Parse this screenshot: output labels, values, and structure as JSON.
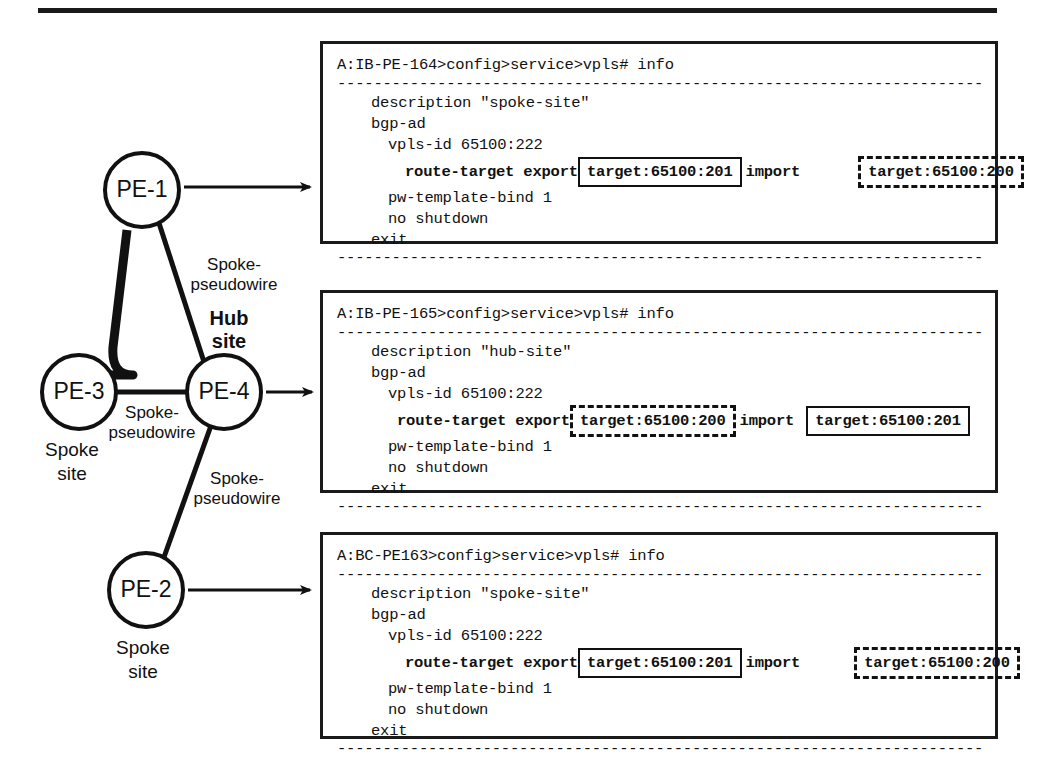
{
  "figure": {
    "title_rule": true
  },
  "topology": {
    "nodes": [
      {
        "id": "pe1",
        "label": "PE-1",
        "site": ""
      },
      {
        "id": "pe3",
        "label": "PE-3",
        "site": "Spoke site"
      },
      {
        "id": "pe4",
        "label": "PE-4",
        "site": ""
      },
      {
        "id": "pe2",
        "label": "PE-2",
        "site": "Spoke site"
      }
    ],
    "hub_label_line1": "Hub",
    "hub_label_line2": "site",
    "spoke_site_line1": "Spoke",
    "spoke_site_line2": "site",
    "edges": [
      {
        "from": "pe1",
        "to": "pe4",
        "label_line1": "Spoke-",
        "label_line2": "pseudowire"
      },
      {
        "from": "pe4",
        "to": "pe3",
        "label_line1": "Spoke-",
        "label_line2": "pseudowire"
      },
      {
        "from": "pe4",
        "to": "pe2",
        "label_line1": "Spoke-",
        "label_line2": "pseudowire"
      }
    ]
  },
  "config_boxes": [
    {
      "header": "A:IB-PE-164>config>service>vpls# info",
      "separator": "-------------------------------------------------------------------------------",
      "lines": [
        {
          "indent": 1,
          "text": "description \"spoke-site\""
        },
        {
          "indent": 1,
          "text": "bgp-ad"
        },
        {
          "indent": 2,
          "text": "vpls-id 65100:222"
        }
      ],
      "route_target": {
        "keyword": "route-target export",
        "export_value": "target:65100:201",
        "export_style": "solid",
        "import_keyword": "import",
        "import_value": "target:65100:200",
        "import_style": "dashed",
        "gap_before_import_box": 56,
        "gap_after_export_kw": 0
      },
      "lines_after": [
        {
          "indent": 2,
          "text": "pw-template-bind 1"
        },
        {
          "indent": 2,
          "text": "no shutdown"
        },
        {
          "indent": 1,
          "text": "exit"
        }
      ],
      "footer": "-------------------------------------------------------------------------------"
    },
    {
      "header": "A:IB-PE-165>config>service>vpls# info",
      "separator": "-------------------------------------------------------------------------------",
      "lines": [
        {
          "indent": 1,
          "text": "description \"hub-site\""
        },
        {
          "indent": 1,
          "text": "bgp-ad"
        },
        {
          "indent": 2,
          "text": "vpls-id 65100:222"
        }
      ],
      "route_target": {
        "keyword": "route-target export",
        "export_value": "target:65100:200",
        "export_style": "dashed",
        "import_keyword": "import",
        "import_value": "target:65100:201",
        "import_style": "solid",
        "gap_before_import_box": 10,
        "gap_after_export_kw": 0
      },
      "lines_after": [
        {
          "indent": 2,
          "text": "pw-template-bind 1"
        },
        {
          "indent": 2,
          "text": "no shutdown"
        },
        {
          "indent": 1,
          "text": "exit"
        }
      ],
      "footer": "-------------------------------------------------------------------------------"
    },
    {
      "header": "A:BC-PE163>config>service>vpls# info",
      "separator": "-------------------------------------------------------------------------------",
      "lines": [
        {
          "indent": 1,
          "text": "description \"spoke-site\""
        },
        {
          "indent": 1,
          "text": "bgp-ad"
        },
        {
          "indent": 2,
          "text": "vpls-id 65100:222"
        }
      ],
      "route_target": {
        "keyword": "route-target export",
        "export_value": "target:65100:201",
        "export_style": "solid",
        "import_keyword": "import",
        "import_value": "target:65100:200",
        "import_style": "dashed",
        "gap_before_import_box": 52,
        "gap_after_export_kw": 0
      },
      "lines_after": [
        {
          "indent": 2,
          "text": "pw-template-bind 1"
        },
        {
          "indent": 2,
          "text": "no shutdown"
        },
        {
          "indent": 1,
          "text": "exit"
        }
      ],
      "footer": "-------------------------------------------------------------------------------"
    }
  ],
  "colors": {
    "ink": "#111111",
    "background": "#ffffff"
  }
}
